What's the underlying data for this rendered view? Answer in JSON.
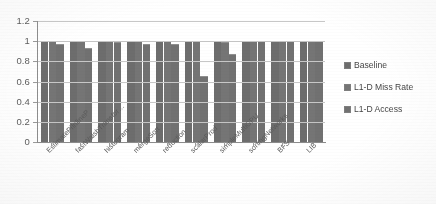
{
  "chart_data": {
    "type": "bar",
    "title": "",
    "xlabel": "",
    "ylabel": "",
    "ylim": [
      0,
      1.2
    ],
    "ytick_labels": [
      "1.2",
      "1",
      "0.8",
      "0.6",
      "0.4",
      "0.2",
      "0"
    ],
    "ytick_values": [
      1.2,
      1.0,
      0.8,
      0.6,
      0.4,
      0.2,
      0
    ],
    "grid": true,
    "legend_position": "right",
    "categories": [
      "EstimatePiInlineP",
      "fastWalshTransfor…",
      "histogram",
      "mergeSort",
      "reduction",
      "scalarProd",
      "simpleMultiGPU",
      "sortingNetworks",
      "BFS",
      "LIB"
    ],
    "series": [
      {
        "name": "Baseline",
        "color": "#6b6b6b",
        "values": [
          1.0,
          1.0,
          1.0,
          1.0,
          1.0,
          1.0,
          1.0,
          1.0,
          1.0,
          1.0
        ]
      },
      {
        "name": "L1-D Miss Rate",
        "color": "#737373",
        "values": [
          1.0,
          1.0,
          1.0,
          1.0,
          1.0,
          1.0,
          0.99,
          1.0,
          1.0,
          1.0
        ]
      },
      {
        "name": "L1-D Access",
        "color": "#6f6f6f",
        "values": [
          0.97,
          0.93,
          0.99,
          0.97,
          0.97,
          0.65,
          0.87,
          1.0,
          1.0,
          1.0
        ]
      }
    ]
  },
  "legend": {
    "items": [
      {
        "label": "Baseline"
      },
      {
        "label": "L1-D Miss Rate"
      },
      {
        "label": "L1-D Access"
      }
    ]
  }
}
